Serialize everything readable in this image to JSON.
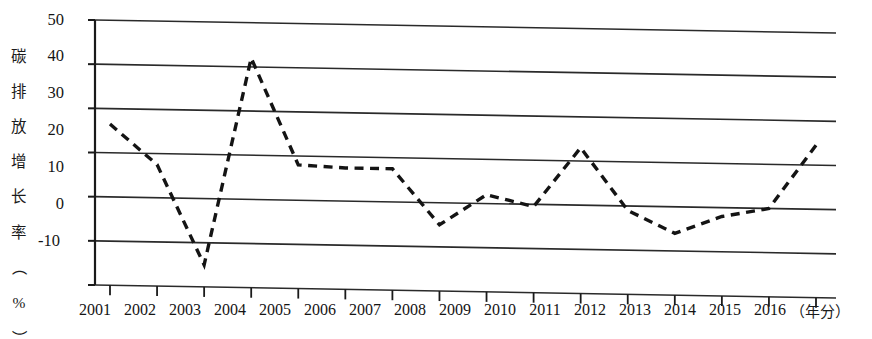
{
  "chart_data": {
    "type": "line",
    "title": "",
    "subtitle": "",
    "xlabel": "（年分）",
    "ylabel": "碳排放增长率（%）",
    "x": [
      2001,
      2002,
      2003,
      2004,
      2005,
      2006,
      2007,
      2008,
      2009,
      2010,
      2011,
      2012,
      2013,
      2014,
      2015,
      2016
    ],
    "categories": [
      "2001",
      "2002",
      "2003",
      "2004",
      "2005",
      "2006",
      "2007",
      "2008",
      "2009",
      "2010",
      "2011",
      "2012",
      "2013",
      "2014",
      "2015",
      "2016"
    ],
    "values": [
      26.5,
      17.5,
      -5,
      42,
      18,
      17.5,
      17.5,
      5,
      12,
      9.5,
      23,
      9,
      4,
      8,
      10,
      24.5
    ],
    "series": [
      {
        "name": "碳排放增长率",
        "values": [
          26.5,
          17.5,
          -5,
          42,
          18,
          17.5,
          17.5,
          5,
          12,
          9.5,
          23,
          9,
          4,
          8,
          10,
          24.5
        ],
        "color": "#141414",
        "line_style": "dashed",
        "markers": false
      }
    ],
    "ylim": [
      -10,
      50
    ],
    "xlim": [
      2001,
      2016
    ],
    "yticks": [
      50,
      40,
      30,
      20,
      10,
      0,
      -10
    ],
    "ytick_labels": [
      "50",
      "40",
      "30",
      "20",
      "10",
      "0",
      "-10"
    ],
    "xtick_labels": [
      "2001",
      "2002",
      "2003",
      "2004",
      "2005",
      "2006",
      "2007",
      "2008",
      "2009",
      "2010",
      "2011",
      "2012",
      "2013",
      "2014",
      "2015",
      "2016"
    ],
    "grid": true,
    "grid_axis": "y",
    "legend": false,
    "legend_position": "none",
    "axis_color": "#1a1a1a",
    "grid_color": "#2a2a2a",
    "background": "#ffffff"
  },
  "axis": {
    "y_title_chars": [
      "碳",
      "排",
      "放",
      "增",
      "长",
      "率",
      "（",
      "%",
      "）"
    ],
    "x_title": "（年分）"
  },
  "yticks": {
    "t0": "50",
    "t1": "40",
    "t2": "30",
    "t3": "20",
    "t4": "10",
    "t5": "0",
    "t6": "-10"
  },
  "xticks": {
    "t0": "2001",
    "t1": "2002",
    "t2": "2003",
    "t3": "2004",
    "t4": "2005",
    "t5": "2006",
    "t6": "2007",
    "t7": "2008",
    "t8": "2009",
    "t9": "2010",
    "t10": "2011",
    "t11": "2012",
    "t12": "2013",
    "t13": "2014",
    "t14": "2015",
    "t15": "2016"
  }
}
